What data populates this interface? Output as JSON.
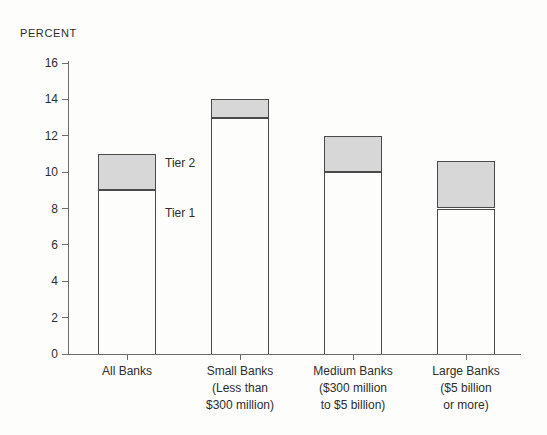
{
  "chart_data": {
    "type": "bar",
    "stacked": true,
    "title": "",
    "ylabel": "PERCENT",
    "xlabel": "",
    "ylim": [
      0,
      16
    ],
    "yticks": [
      0,
      2,
      4,
      6,
      8,
      10,
      12,
      14,
      16
    ],
    "grid": false,
    "legend_position": "inline-annotations-right-of-first-bar",
    "categories": [
      {
        "label_lines": [
          "All Banks"
        ]
      },
      {
        "label_lines": [
          "Small Banks",
          "(Less than",
          "$300 million)"
        ]
      },
      {
        "label_lines": [
          "Medium Banks",
          "($300 million",
          "to $5 billion)"
        ]
      },
      {
        "label_lines": [
          "Large Banks",
          "($5 billion",
          "or more)"
        ]
      }
    ],
    "series": [
      {
        "name": "Tier 1",
        "values": [
          9.0,
          13.0,
          10.0,
          8.0
        ],
        "fill": "#fdfdfc"
      },
      {
        "name": "Tier 2",
        "values": [
          2.0,
          1.0,
          2.0,
          2.6
        ],
        "fill": "#d7d7d7"
      }
    ],
    "totals": [
      11.0,
      14.0,
      12.0,
      10.6
    ],
    "annotations": [
      {
        "text": "Tier 2"
      },
      {
        "text": "Tier 1"
      }
    ]
  },
  "colors": {
    "bar_border": "#4a4a4a",
    "tier2_fill": "#d7d7d7",
    "tier1_fill": "#fdfdfc",
    "axis": "#6d6d6d",
    "text": "#2d2d2d",
    "background": "#fdfdfc"
  }
}
